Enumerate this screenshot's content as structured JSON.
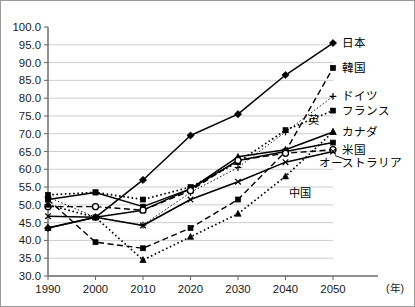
{
  "chart_data": {
    "type": "line",
    "title": "",
    "xlabel": "(年)",
    "ylabel": "",
    "x": [
      1990,
      2000,
      2010,
      2020,
      2030,
      2040,
      2050
    ],
    "xtick_labels": [
      "1990",
      "2000",
      "2010",
      "2020",
      "2030",
      "2040",
      "2050"
    ],
    "ytick_labels": [
      "100.0",
      "95.0",
      "90.0",
      "85.0",
      "80.0",
      "75.0",
      "70.0",
      "65.0",
      "60.0",
      "55.0",
      "50.0",
      "45.0",
      "40.0",
      "35.0",
      "30.0"
    ],
    "ylim": [
      30.0,
      100.0
    ],
    "ytick_step": 5.0,
    "xlim": [
      1990,
      2050
    ],
    "grid": true,
    "legend_position": "right-inline",
    "series": [
      {
        "name": "日本",
        "label": "日本",
        "marker": "diamond",
        "linestyle": "solid",
        "values": [
          43.5,
          46.5,
          57.0,
          69.5,
          75.5,
          86.5,
          95.5
        ]
      },
      {
        "name": "韓国",
        "label": "韓国",
        "marker": "square",
        "linestyle": "dashed",
        "values": [
          51.5,
          39.5,
          37.8,
          43.5,
          51.5,
          65.0,
          88.5
        ]
      },
      {
        "name": "ドイツ",
        "label": "ドイツ",
        "marker": "plus",
        "linestyle": "dotted-thin",
        "values": [
          52.2,
          46.5,
          44.3,
          53.5,
          60.5,
          70.5,
          80.5
        ]
      },
      {
        "name": "フランス",
        "label": "フランス",
        "marker": "square",
        "linestyle": "dotted",
        "values": [
          52.8,
          53.5,
          51.5,
          55.0,
          62.0,
          71.0,
          76.5
        ]
      },
      {
        "name": "カナダ",
        "label": "カナダ",
        "marker": "triangle",
        "linestyle": "solid",
        "values": [
          43.5,
          46.5,
          48.5,
          54.5,
          63.5,
          65.5,
          70.5
        ]
      },
      {
        "name": "英",
        "label": "英",
        "marker": "square",
        "linestyle": "solid",
        "values": [
          51.5,
          53.5,
          49.5,
          54.5,
          62.5,
          65.0,
          67.5
        ]
      },
      {
        "name": "米国",
        "label": "米国",
        "marker": "circle",
        "linestyle": "dashed",
        "values": [
          49.5,
          49.5,
          48.5,
          54.0,
          62.5,
          64.5,
          65.5
        ]
      },
      {
        "name": "オーストラリア",
        "label": "オーストラリア",
        "marker": "cross",
        "linestyle": "solid",
        "values": [
          46.8,
          46.5,
          44.2,
          51.5,
          56.5,
          62.0,
          65.0
        ]
      },
      {
        "name": "中国",
        "label": "中国",
        "marker": "triangle",
        "linestyle": "dotted",
        "values": [
          50.0,
          46.5,
          34.5,
          41.0,
          47.5,
          58.0,
          70.5
        ]
      }
    ]
  },
  "axes": {
    "y_unit": "",
    "x_unit": "(年)"
  }
}
